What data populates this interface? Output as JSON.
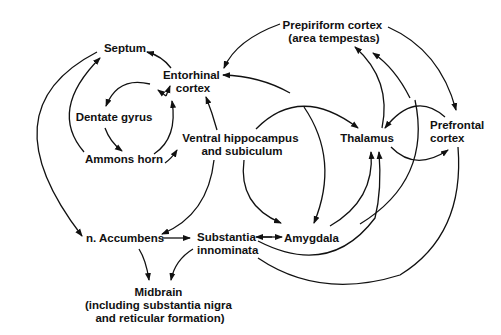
{
  "nodes": {
    "septum": {
      "lines": [
        "Septum"
      ]
    },
    "entorhinal": {
      "lines": [
        "Entorhinal",
        "cortex"
      ]
    },
    "dentate": {
      "lines": [
        "Dentate gyrus"
      ]
    },
    "ammons": {
      "lines": [
        "Ammons horn"
      ]
    },
    "ventral": {
      "lines": [
        "Ventral hippocampus",
        "and subiculum"
      ]
    },
    "prepiriform": {
      "lines": [
        "Prepiriform cortex",
        "(area tempestas)"
      ]
    },
    "thalamus": {
      "lines": [
        "Thalamus"
      ]
    },
    "prefrontal": {
      "lines": [
        "Prefrontal",
        "cortex"
      ]
    },
    "accumbens": {
      "lines": [
        "n. Accumbens"
      ]
    },
    "substantia": {
      "lines": [
        "Substantia",
        "innominata"
      ]
    },
    "amygdala": {
      "lines": [
        "Amygdala"
      ]
    },
    "midbrain": {
      "lines": [
        "Midbrain",
        "(including substantia nigra",
        "and reticular formation)"
      ]
    }
  },
  "edges": [
    {
      "from": "Entorhinal cortex",
      "to": "Septum"
    },
    {
      "from": "Entorhinal cortex",
      "to": "Dentate gyrus"
    },
    {
      "from": "Dentate gyrus",
      "to": "Ammons horn"
    },
    {
      "from": "Ammons horn",
      "to": "Entorhinal cortex"
    },
    {
      "from": "Ammons horn",
      "to": "Septum"
    },
    {
      "from": "Ammons horn",
      "to": "Ventral hippocampus and subiculum"
    },
    {
      "from": "Ventral hippocampus and subiculum",
      "to": "Entorhinal cortex"
    },
    {
      "from": "Ventral hippocampus and subiculum",
      "to": "n. Accumbens"
    },
    {
      "from": "Ventral hippocampus and subiculum",
      "to": "Thalamus"
    },
    {
      "from": "Ventral hippocampus and subiculum",
      "to": "Amygdala"
    },
    {
      "from": "Septum",
      "to": "n. Accumbens"
    },
    {
      "from": "Prepiriform cortex",
      "to": "Entorhinal cortex"
    },
    {
      "from": "Prepiriform cortex",
      "to": "Thalamus"
    },
    {
      "from": "Prepiriform cortex",
      "to": "Prefrontal cortex"
    },
    {
      "from": "Prepiriform cortex",
      "to": "Amygdala"
    },
    {
      "from": "Thalamus",
      "to": "Prepiriform cortex"
    },
    {
      "from": "Thalamus",
      "to": "Prefrontal cortex"
    },
    {
      "from": "Prefrontal cortex",
      "to": "Thalamus"
    },
    {
      "from": "Prefrontal cortex",
      "to": "Prepiriform cortex"
    },
    {
      "from": "Prefrontal cortex",
      "to": "Amygdala"
    },
    {
      "from": "Entorhinal cortex",
      "to": "Amygdala"
    },
    {
      "from": "Amygdala",
      "to": "Thalamus"
    },
    {
      "from": "Substantia innominata",
      "to": "Thalamus"
    },
    {
      "from": "Substantia innominata",
      "to": "Amygdala"
    },
    {
      "from": "Amygdala",
      "to": "Substantia innominata"
    },
    {
      "from": "Substantia innominata",
      "to": "Prefrontal cortex"
    },
    {
      "from": "n. Accumbens",
      "to": "Substantia innominata"
    },
    {
      "from": "n. Accumbens",
      "to": "Midbrain"
    },
    {
      "from": "Substantia innominata",
      "to": "Midbrain"
    }
  ]
}
